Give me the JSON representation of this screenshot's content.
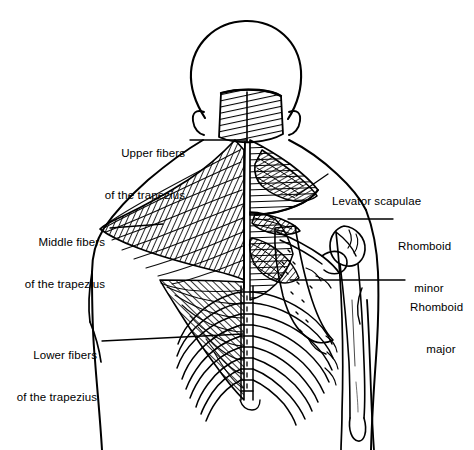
{
  "figure": {
    "background_color": "#ffffff",
    "ink_color": "#000000",
    "width": 474,
    "height": 450
  },
  "labels": [
    {
      "id": "upper-fibers",
      "line1": "Upper fibers",
      "line2": "of the trapezius",
      "align": "right",
      "x": 108,
      "y": 118,
      "leader": {
        "x1": 190,
        "y1": 140,
        "x2": 247,
        "y2": 140
      }
    },
    {
      "id": "middle-fibers",
      "line1": "Middle fibers",
      "line2": "of the trapezius",
      "align": "right",
      "x": 28,
      "y": 207,
      "leader": {
        "x1": 110,
        "y1": 228,
        "x2": 163,
        "y2": 224
      }
    },
    {
      "id": "lower-fibers",
      "line1": "Lower fibers",
      "line2": "of the trapezius",
      "align": "right",
      "x": 20,
      "y": 320,
      "leader": {
        "x1": 102,
        "y1": 341,
        "x2": 243,
        "y2": 334
      }
    },
    {
      "id": "levator-scapulae",
      "line1": "Levator scapulae",
      "line2": "",
      "align": "left",
      "x": 332,
      "y": 166,
      "leader": {
        "x1": 328,
        "y1": 174,
        "x2": 296,
        "y2": 196
      }
    },
    {
      "id": "rhomboid-minor",
      "line1": "Rhomboid",
      "line2": "minor",
      "align": "left",
      "x": 398,
      "y": 211,
      "leader": {
        "x1": 393,
        "y1": 219,
        "x2": 288,
        "y2": 219
      }
    },
    {
      "id": "rhomboid-major",
      "line1": "Rhomboid",
      "line2": "major",
      "align": "left",
      "x": 410,
      "y": 272,
      "leader": {
        "x1": 405,
        "y1": 280,
        "x2": 290,
        "y2": 280
      }
    }
  ],
  "structures": [
    {
      "id": "head",
      "name": "head-outline"
    },
    {
      "id": "ear-left",
      "name": "left-ear"
    },
    {
      "id": "ear-right",
      "name": "right-ear"
    },
    {
      "id": "trapezius-upper",
      "name": "upper-trapezius-fibers"
    },
    {
      "id": "trapezius-middle",
      "name": "middle-trapezius-fibers"
    },
    {
      "id": "trapezius-lower",
      "name": "lower-trapezius-fibers"
    },
    {
      "id": "levator",
      "name": "levator-scapulae-muscle"
    },
    {
      "id": "rhomboid-min",
      "name": "rhomboid-minor-muscle"
    },
    {
      "id": "rhomboid-maj",
      "name": "rhomboid-major-muscle"
    },
    {
      "id": "scapula",
      "name": "scapula-bone"
    },
    {
      "id": "humerus",
      "name": "humerus-bone"
    },
    {
      "id": "ribcage",
      "name": "rib-cage"
    },
    {
      "id": "spine",
      "name": "vertebral-column"
    },
    {
      "id": "torso",
      "name": "torso-outline"
    },
    {
      "id": "arm-left",
      "name": "left-arm-outline"
    },
    {
      "id": "arm-right",
      "name": "right-arm-outline"
    }
  ]
}
